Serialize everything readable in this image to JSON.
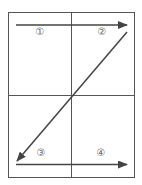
{
  "diagram": {
    "colors": {
      "line": "#444444",
      "grid": "#555555",
      "label": "#666666"
    },
    "quadrants": [
      {
        "id": 1,
        "label": "①",
        "position": "top-left"
      },
      {
        "id": 2,
        "label": "②",
        "position": "top-right"
      },
      {
        "id": 3,
        "label": "③",
        "position": "bottom-left"
      },
      {
        "id": 4,
        "label": "④",
        "position": "bottom-right"
      }
    ],
    "arrows": [
      {
        "name": "top-arrow",
        "from": "left",
        "to": "right"
      },
      {
        "name": "diagonal-arrow",
        "from": "top-right",
        "to": "bottom-left"
      },
      {
        "name": "bottom-arrow",
        "from": "left",
        "to": "right"
      }
    ]
  }
}
